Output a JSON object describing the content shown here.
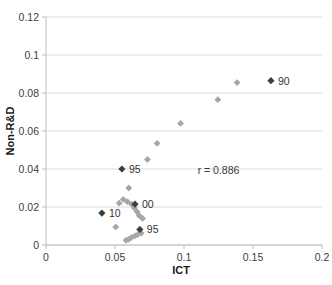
{
  "chart_data": {
    "type": "scatter",
    "title": "",
    "xlabel": "ICT",
    "ylabel": "Non-R&D",
    "xlim": [
      0,
      0.2
    ],
    "ylim": [
      0,
      0.12
    ],
    "xticks": [
      "0",
      "0.05",
      "0.1",
      "0.15",
      "0.2"
    ],
    "xtick_values": [
      0,
      0.05,
      0.1,
      0.15,
      0.2
    ],
    "yticks": [
      "0",
      "0.02",
      "0.04",
      "0.06",
      "0.08",
      "0.1",
      "0.12"
    ],
    "ytick_values": [
      0,
      0.02,
      0.04,
      0.06,
      0.08,
      0.1,
      0.12
    ],
    "grid": "horizontal",
    "legend": "none",
    "annotations": [
      {
        "text": "r = 0.886",
        "x": 0.125,
        "y": 0.0375
      }
    ],
    "series": [
      {
        "name": "unlabeled-observations",
        "color": "#a6a6a6",
        "marker": "diamond",
        "points": [
          {
            "x": 0.1385,
            "y": 0.0855
          },
          {
            "x": 0.1245,
            "y": 0.0765
          },
          {
            "x": 0.0975,
            "y": 0.064
          },
          {
            "x": 0.0805,
            "y": 0.0535
          },
          {
            "x": 0.0735,
            "y": 0.045
          },
          {
            "x": 0.06,
            "y": 0.03
          },
          {
            "x": 0.056,
            "y": 0.024
          },
          {
            "x": 0.059,
            "y": 0.0228
          },
          {
            "x": 0.062,
            "y": 0.0215
          },
          {
            "x": 0.053,
            "y": 0.022
          },
          {
            "x": 0.064,
            "y": 0.0195
          },
          {
            "x": 0.066,
            "y": 0.0175
          },
          {
            "x": 0.0675,
            "y": 0.0155
          },
          {
            "x": 0.07,
            "y": 0.014
          },
          {
            "x": 0.0505,
            "y": 0.0095
          },
          {
            "x": 0.062,
            "y": 0.004
          },
          {
            "x": 0.0645,
            "y": 0.0048
          },
          {
            "x": 0.0665,
            "y": 0.0055
          },
          {
            "x": 0.069,
            "y": 0.0062
          },
          {
            "x": 0.06,
            "y": 0.003
          },
          {
            "x": 0.058,
            "y": 0.0025
          }
        ]
      },
      {
        "name": "labeled-years",
        "color": "#3d3d3d",
        "marker": "diamond",
        "points": [
          {
            "x": 0.163,
            "y": 0.0865,
            "label": "90"
          },
          {
            "x": 0.055,
            "y": 0.04,
            "label": "95"
          },
          {
            "x": 0.0645,
            "y": 0.0215,
            "label": "00"
          },
          {
            "x": 0.0405,
            "y": 0.0168,
            "label": "10"
          },
          {
            "x": 0.068,
            "y": 0.0082,
            "label": "95"
          }
        ]
      }
    ]
  }
}
